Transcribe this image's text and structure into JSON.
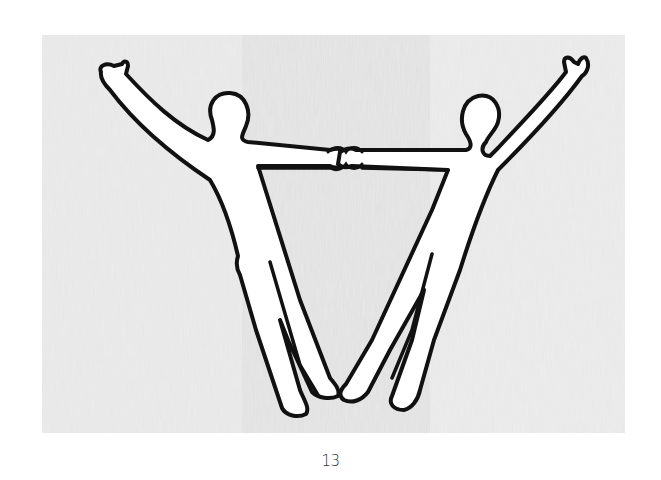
{
  "page": {
    "number": "13"
  },
  "illustration": {
    "subject": "two-figures-holding-hands-v-shape",
    "colors": {
      "paper": "#e9e9e9",
      "figure_fill": "#ffffff",
      "outline": "#111111"
    }
  }
}
